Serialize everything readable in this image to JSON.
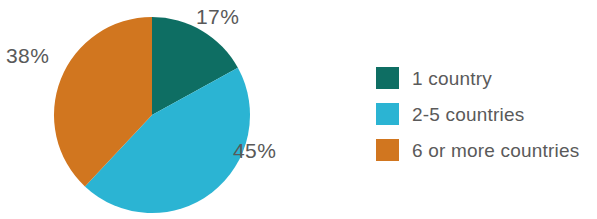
{
  "chart_data": {
    "type": "pie",
    "title": "",
    "subtitle": "",
    "xlabel": "",
    "ylabel": "",
    "grid": false,
    "legend_position": "right",
    "start_angle_deg": 0,
    "direction": "clockwise",
    "center": {
      "x": 152,
      "y": 115
    },
    "radius": 98,
    "categories": [
      "1 country",
      "2-5 countries",
      "6 or more countries"
    ],
    "values": [
      17,
      45,
      38
    ],
    "value_unit": "%",
    "colors": [
      "#0e6e63",
      "#2bb4d3",
      "#d1761f"
    ],
    "slices": [
      {
        "label": "1 country",
        "value": 17,
        "data_label": "17%",
        "color": "#0e6e63",
        "start_angle_deg": 0,
        "end_angle_deg": 61.2
      },
      {
        "label": "2-5 countries",
        "value": 45,
        "data_label": "45%",
        "color": "#2bb4d3",
        "start_angle_deg": 61.2,
        "end_angle_deg": 223.2
      },
      {
        "label": "6 or more countries",
        "value": 38,
        "data_label": "38%",
        "color": "#d1761f",
        "start_angle_deg": 223.2,
        "end_angle_deg": 360
      }
    ],
    "data_labels": [
      "17%",
      "45%",
      "38%"
    ]
  },
  "labels": {
    "pct_teal": "17%",
    "pct_orange": "38%",
    "pct_cyan": "45%"
  },
  "legend": {
    "items": [
      {
        "label": "1 country",
        "color": "#0e6e63"
      },
      {
        "label": "2-5 countries",
        "color": "#2bb4d3"
      },
      {
        "label": "6 or more countries",
        "color": "#d1761f"
      }
    ]
  },
  "colors": {
    "teal": "#0e6e63",
    "cyan": "#2bb4d3",
    "orange": "#d1761f",
    "text": "#595959",
    "background": "#ffffff"
  }
}
